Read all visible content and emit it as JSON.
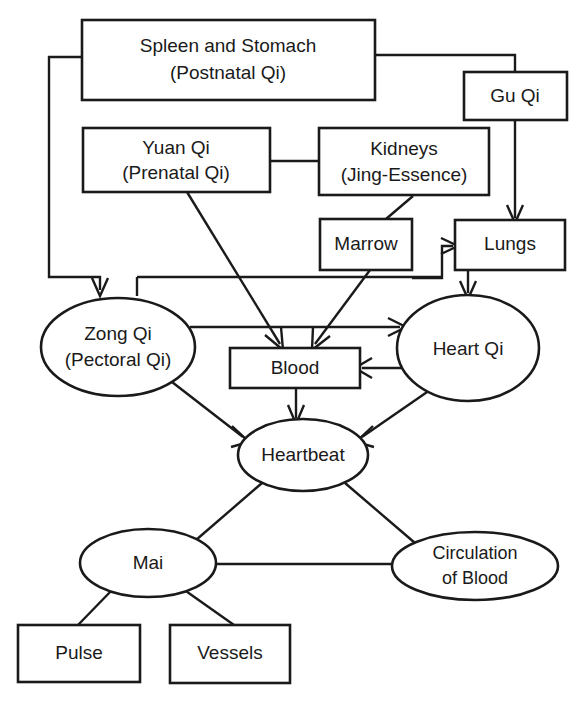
{
  "diagram": {
    "type": "flowchart",
    "background_color": "#ffffff",
    "line_color": "#1a1a1a",
    "nodes": [
      {
        "id": "spleen",
        "shape": "rect",
        "label_line1": "Spleen and Stomach",
        "label_line2": "(Postnatal Qi)"
      },
      {
        "id": "guqi",
        "shape": "rect",
        "label_line1": "Gu Qi",
        "label_line2": ""
      },
      {
        "id": "yuanqi",
        "shape": "rect",
        "label_line1": "Yuan Qi",
        "label_line2": "(Prenatal Qi)"
      },
      {
        "id": "kidneys",
        "shape": "rect",
        "label_line1": "Kidneys",
        "label_line2": "(Jing-Essence)"
      },
      {
        "id": "marrow",
        "shape": "rect",
        "label_line1": "Marrow",
        "label_line2": ""
      },
      {
        "id": "lungs",
        "shape": "rect",
        "label_line1": "Lungs",
        "label_line2": ""
      },
      {
        "id": "zongqi",
        "shape": "ellipse",
        "label_line1": "Zong Qi",
        "label_line2": "(Pectoral Qi)"
      },
      {
        "id": "blood",
        "shape": "rect",
        "label_line1": "Blood",
        "label_line2": ""
      },
      {
        "id": "heartqi",
        "shape": "ellipse",
        "label_line1": "Heart Qi",
        "label_line2": ""
      },
      {
        "id": "heartbeat",
        "shape": "ellipse",
        "label_line1": "Heartbeat",
        "label_line2": ""
      },
      {
        "id": "mai",
        "shape": "ellipse",
        "label_line1": "Mai",
        "label_line2": ""
      },
      {
        "id": "circulation",
        "shape": "ellipse",
        "label_line1": "Circulation",
        "label_line2": "of Blood"
      },
      {
        "id": "pulse",
        "shape": "rect",
        "label_line1": "Pulse",
        "label_line2": ""
      },
      {
        "id": "vessels",
        "shape": "rect",
        "label_line1": "Vessels",
        "label_line2": ""
      }
    ],
    "edges": [
      {
        "from": "spleen",
        "to": "zongqi",
        "arrow": true
      },
      {
        "from": "spleen",
        "to": "guqi",
        "arrow": false
      },
      {
        "from": "guqi",
        "to": "lungs",
        "arrow": true
      },
      {
        "from": "yuanqi",
        "to": "kidneys",
        "arrow": false
      },
      {
        "from": "yuanqi",
        "to": "blood",
        "arrow": true
      },
      {
        "from": "kidneys",
        "to": "marrow",
        "arrow": false
      },
      {
        "from": "marrow",
        "to": "blood",
        "arrow": true
      },
      {
        "from": "marrow",
        "to": "lungs",
        "arrow": true
      },
      {
        "from": "lungs",
        "to": "heartqi",
        "arrow": true
      },
      {
        "from": "zongqi",
        "to": "heartqi",
        "arrow": true
      },
      {
        "from": "zongqi",
        "to": "heartbeat",
        "arrow": true
      },
      {
        "from": "heartqi",
        "to": "blood",
        "arrow": true
      },
      {
        "from": "heartqi",
        "to": "heartbeat",
        "arrow": true
      },
      {
        "from": "blood",
        "to": "heartbeat",
        "arrow": true
      },
      {
        "from": "heartbeat",
        "to": "mai",
        "arrow": false
      },
      {
        "from": "heartbeat",
        "to": "circulation",
        "arrow": false
      },
      {
        "from": "mai",
        "to": "circulation",
        "arrow": false
      },
      {
        "from": "mai",
        "to": "pulse",
        "arrow": false
      },
      {
        "from": "mai",
        "to": "vessels",
        "arrow": false
      }
    ]
  }
}
